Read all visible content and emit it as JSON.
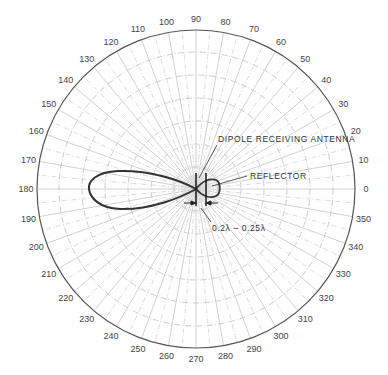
{
  "diagram": {
    "type": "polar-radiation-pattern",
    "center": {
      "x": 196,
      "y": 189
    },
    "outer_radius": 159,
    "inner_ring_radii": [
      22,
      45,
      68,
      91,
      114,
      137
    ],
    "angle_labels": [
      "0",
      "10",
      "20",
      "30",
      "40",
      "50",
      "60",
      "70",
      "80",
      "90",
      "100",
      "110",
      "120",
      "130",
      "140",
      "150",
      "160",
      "170",
      "180",
      "190",
      "200",
      "210",
      "220",
      "230",
      "240",
      "250",
      "260",
      "270",
      "280",
      "290",
      "300",
      "310",
      "320",
      "330",
      "340",
      "350"
    ],
    "colors": {
      "grid": "#cccccc",
      "outer_ring": "#555555",
      "pattern": "#333333",
      "text": "#333333"
    },
    "annotations": {
      "dipole": "DIPOLE RECEIVING ANTENNA",
      "reflector": "REFLECTOR",
      "spacing": "0.2λ – 0.25λ"
    },
    "pattern": {
      "main_lobe_direction_deg": 180,
      "main_lobe_extent_px": 106,
      "back_lobe_direction_deg": 0,
      "back_lobe_extent_px": 24
    }
  }
}
